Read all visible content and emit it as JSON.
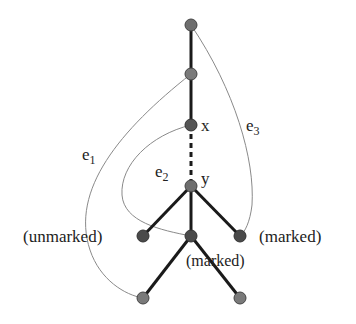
{
  "diagram": {
    "type": "tree-with-extra-edges",
    "nodes": [
      {
        "id": "r",
        "x": 191,
        "y": 25,
        "label": ""
      },
      {
        "id": "a",
        "x": 191,
        "y": 74,
        "label": ""
      },
      {
        "id": "x",
        "x": 191,
        "y": 125,
        "label": "x"
      },
      {
        "id": "y",
        "x": 191,
        "y": 186,
        "label": "y"
      },
      {
        "id": "l",
        "x": 143,
        "y": 236,
        "label": "(unmarked)"
      },
      {
        "id": "m",
        "x": 191,
        "y": 236,
        "label": "(marked)"
      },
      {
        "id": "rt",
        "x": 240,
        "y": 236,
        "label": "(marked)"
      },
      {
        "id": "bl",
        "x": 143,
        "y": 298,
        "label": ""
      },
      {
        "id": "br",
        "x": 240,
        "y": 298,
        "label": ""
      }
    ],
    "tree_edges": [
      [
        "r",
        "a"
      ],
      [
        "a",
        "x"
      ],
      [
        "y",
        "l"
      ],
      [
        "y",
        "m"
      ],
      [
        "y",
        "rt"
      ],
      [
        "m",
        "bl"
      ],
      [
        "m",
        "br"
      ]
    ],
    "dashed_edge": [
      "x",
      "y"
    ],
    "extra_edges": [
      {
        "name": "e1",
        "label": "e",
        "sub": "1",
        "from": "a",
        "to": "bl"
      },
      {
        "name": "e2",
        "label": "e",
        "sub": "2",
        "from": "x",
        "to": "m"
      },
      {
        "name": "e3",
        "label": "e",
        "sub": "3",
        "from": "r",
        "to": "rt"
      }
    ],
    "labels": {
      "x": "x",
      "y": "y",
      "left": "(unmarked)",
      "middle": "(marked)",
      "right": "(marked)",
      "e1_main": "e",
      "e1_sub": "1",
      "e2_main": "e",
      "e2_sub": "2",
      "e3_main": "e",
      "e3_sub": "3"
    },
    "colors": {
      "node_fill": "#6e6e6e",
      "node_stroke": "#444444",
      "tree_edge": "#1a1a1a",
      "extra_edge": "#8a8a8a"
    }
  }
}
